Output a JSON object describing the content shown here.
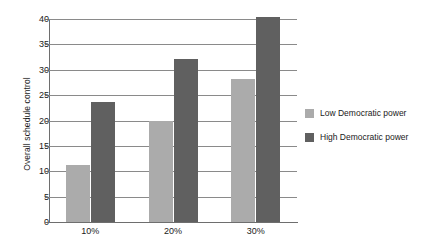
{
  "chart_data": {
    "type": "bar",
    "title": "",
    "subtitle": "",
    "xlabel": "",
    "ylabel": "Overall schedule control",
    "categories": [
      "10%",
      "20%",
      "30%"
    ],
    "series": [
      {
        "name": "Low Democratic power",
        "color": "#ababab",
        "values": [
          11.2,
          20.0,
          28.2
        ]
      },
      {
        "name": "High Democratic power",
        "color": "#606060",
        "values": [
          23.7,
          32.1,
          40.3
        ]
      }
    ],
    "ylim": [
      0,
      40
    ],
    "ytick_step": 5,
    "yticks": [
      "0",
      "5",
      "10",
      "15",
      "20",
      "25",
      "30",
      "35",
      "40"
    ],
    "grid": "horizontal",
    "legend_position": "right"
  },
  "legend": {
    "items": [
      {
        "label": "Low Democratic power",
        "swatch": "#ababab"
      },
      {
        "label": "High Democratic power",
        "swatch": "#606060"
      }
    ]
  }
}
